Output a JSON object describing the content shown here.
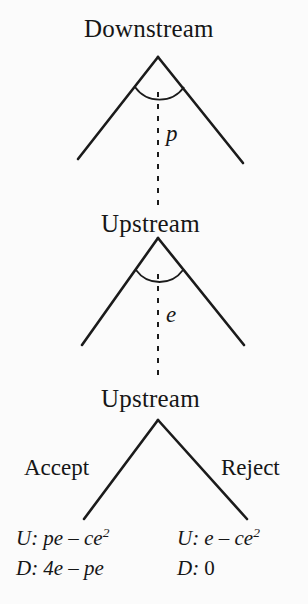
{
  "diagram": {
    "type": "extensive-form-game-tree",
    "title_visible": false,
    "background_color": "#fbfbfb",
    "line_color": "#1b1b1b",
    "nodes": [
      {
        "id": "n1",
        "label": "Downstream",
        "x": 158,
        "y": 57,
        "decision_variable": "p"
      },
      {
        "id": "n2",
        "label": "Upstream",
        "x": 158,
        "y": 238,
        "decision_variable": "e"
      },
      {
        "id": "n3",
        "label": "Upstream",
        "x": 158,
        "y": 420,
        "decision_variable": ""
      }
    ],
    "edge_variables": [
      {
        "id": "p",
        "label": "p",
        "node": "n1"
      },
      {
        "id": "e",
        "label": "e",
        "node": "n2"
      }
    ],
    "branch_labels": [
      {
        "id": "accept",
        "label": "Accept",
        "side": "left"
      },
      {
        "id": "reject",
        "label": "Reject",
        "side": "right"
      }
    ],
    "payoffs": [
      {
        "branch": "accept",
        "lines": [
          {
            "player": "U:",
            "expression": "pe – ce",
            "exponent": "2"
          },
          {
            "player": "D:",
            "expression": "4e – pe",
            "exponent": ""
          }
        ]
      },
      {
        "branch": "reject",
        "lines": [
          {
            "player": "U:",
            "expression": "e – ce",
            "exponent": "2"
          },
          {
            "player": "D:",
            "expression": "0",
            "exponent": ""
          }
        ]
      }
    ]
  }
}
